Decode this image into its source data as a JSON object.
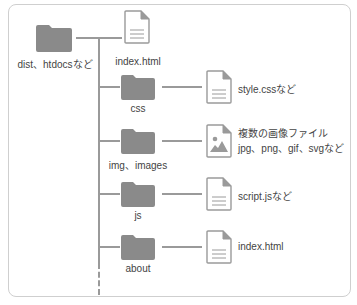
{
  "diagram": {
    "root": {
      "label": "dist、htdocsなど",
      "icon": "folder-icon"
    },
    "root_file": {
      "label": "index.html",
      "icon": "file-icon"
    },
    "branches": [
      {
        "folder": "css",
        "file_icon": "file-icon",
        "file_label": "style.cssなど"
      },
      {
        "folder": "img、images",
        "file_icon": "image-file-icon",
        "file_label_line1": "複数の画像ファイル",
        "file_label_line2": "jpg、png、gif、svgなど"
      },
      {
        "folder": "js",
        "file_icon": "file-icon",
        "file_label": "script.jsなど"
      },
      {
        "folder": "about",
        "file_icon": "file-icon",
        "file_label": "index.html"
      }
    ],
    "colors": {
      "folder": "#8a8a8a",
      "line": "#9a9a9a",
      "border": "#cfcfcf",
      "text": "#444444"
    }
  }
}
